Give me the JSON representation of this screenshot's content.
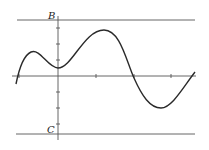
{
  "diagram": {
    "type": "function-graph",
    "labels": {
      "top_line": "B",
      "bottom_line": "C"
    },
    "colors": {
      "curve": "#2a2a2a",
      "axes": "#555555",
      "lines": "#555555"
    },
    "axes": {
      "x_axis_y": 76,
      "y_axis_x": 58,
      "x_ticks": [
        19,
        58,
        96,
        134,
        171
      ],
      "y_ticks": [
        28,
        44,
        60,
        92,
        108,
        124
      ]
    },
    "horizontal_lines": {
      "B_y": 20,
      "C_y": 134
    },
    "curve_points": [
      [
        16,
        84
      ],
      [
        19,
        76
      ],
      [
        31,
        52
      ],
      [
        58,
        68
      ],
      [
        104,
        30
      ],
      [
        134,
        76
      ],
      [
        161,
        108
      ],
      [
        195,
        72
      ]
    ]
  }
}
